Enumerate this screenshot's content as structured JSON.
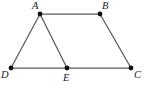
{
  "figure": {
    "kind": "geometry-diagram",
    "canvas": {
      "width": 151,
      "height": 89,
      "background": "#ffffff"
    },
    "style": {
      "edge_color": "#5a5a5a",
      "edge_width": 1.25,
      "vertex_color": "#111111",
      "vertex_radius": 2.4,
      "label_color": "#1a1a1a",
      "label_font_size": 10.5
    },
    "vertices": [
      {
        "id": "A",
        "label": "A",
        "x": 40,
        "y": 14,
        "label_x": 32,
        "label_y": 1,
        "label_name": "vertex-label-a"
      },
      {
        "id": "B",
        "label": "B",
        "x": 100,
        "y": 14,
        "label_x": 102,
        "label_y": 1,
        "label_name": "vertex-label-b"
      },
      {
        "id": "C",
        "label": "C",
        "x": 131,
        "y": 68,
        "label_x": 134,
        "label_y": 70,
        "label_name": "vertex-label-c"
      },
      {
        "id": "D",
        "label": "D",
        "x": 11,
        "y": 68,
        "label_x": 1,
        "label_y": 70,
        "label_name": "vertex-label-d"
      },
      {
        "id": "E",
        "label": "E",
        "x": 67,
        "y": 68,
        "label_x": 63,
        "label_y": 73,
        "label_name": "vertex-label-e"
      }
    ],
    "edges": [
      {
        "id": "AB",
        "from": "A",
        "to": "B",
        "name": "edge-a-b"
      },
      {
        "id": "AD",
        "from": "A",
        "to": "D",
        "name": "edge-a-d"
      },
      {
        "id": "AE",
        "from": "A",
        "to": "E",
        "name": "edge-a-e"
      },
      {
        "id": "BC",
        "from": "B",
        "to": "C",
        "name": "edge-b-c"
      },
      {
        "id": "DE",
        "from": "D",
        "to": "E",
        "name": "edge-d-e"
      },
      {
        "id": "EC",
        "from": "E",
        "to": "C",
        "name": "edge-e-c"
      }
    ]
  }
}
